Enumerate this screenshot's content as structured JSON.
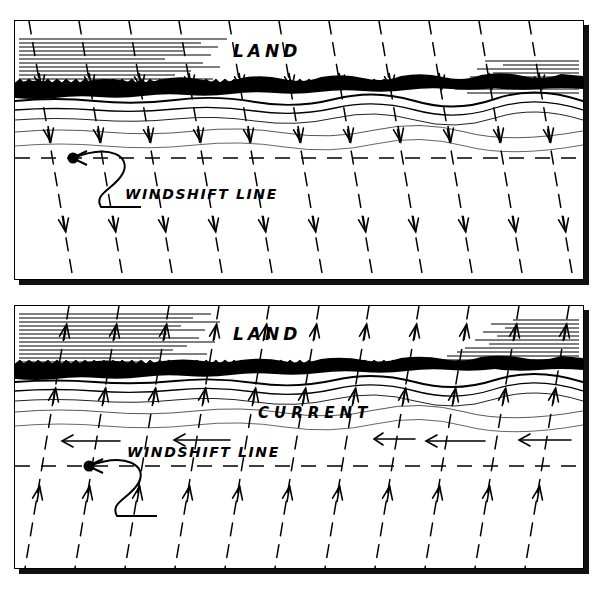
{
  "figure": {
    "type": "diagram",
    "panel_count": 2
  },
  "panels": [
    {
      "id": "offshore",
      "name": "offshore-wind-panel",
      "labels": {
        "land": "LAND",
        "windshift": "WINDSHIFT LINE"
      },
      "wind": {
        "direction": "offshore",
        "flow_description": "dashed wind streamlines slanting from upper-left to lower-right, arrowheads pointing down and away from land",
        "streamline_count": 11,
        "arrowheads_per_line": 3,
        "slant_dx": 44
      },
      "shore": {
        "beach_band": "thick black ragged shoreline band",
        "water_lines": 5
      },
      "hatching": {
        "top_left": true,
        "top_right": true,
        "line_count_left": 13,
        "line_count_right": 9
      },
      "windshift_line": {
        "style": "dashed horizontal",
        "marker": "filled dot with curved leader arrow"
      }
    },
    {
      "id": "onshore",
      "name": "onshore-wind-panel",
      "labels": {
        "land": "LAND",
        "current": "CURRENT",
        "windshift": "WINDSHIFT LINE"
      },
      "wind": {
        "direction": "onshore",
        "flow_description": "dashed wind streamlines slanting from lower-right to upper-left, arrowheads pointing up toward land",
        "streamline_count": 11,
        "arrowheads_per_line": 3,
        "slant_dx": -44
      },
      "current": {
        "direction": "leftward",
        "arrow_count": 5,
        "label": "CURRENT"
      },
      "shore": {
        "beach_band": "thick black ragged shoreline band",
        "water_lines": 5
      },
      "hatching": {
        "top_left": true,
        "top_right": true,
        "line_count_left": 13,
        "line_count_right": 11
      },
      "windshift_line": {
        "style": "dashed horizontal",
        "marker": "filled dot with curved leader arrow"
      }
    }
  ],
  "style": {
    "ink": "#000000",
    "paper": "#ffffff",
    "shadow": "#111111",
    "water_line_gray": "#555555"
  }
}
